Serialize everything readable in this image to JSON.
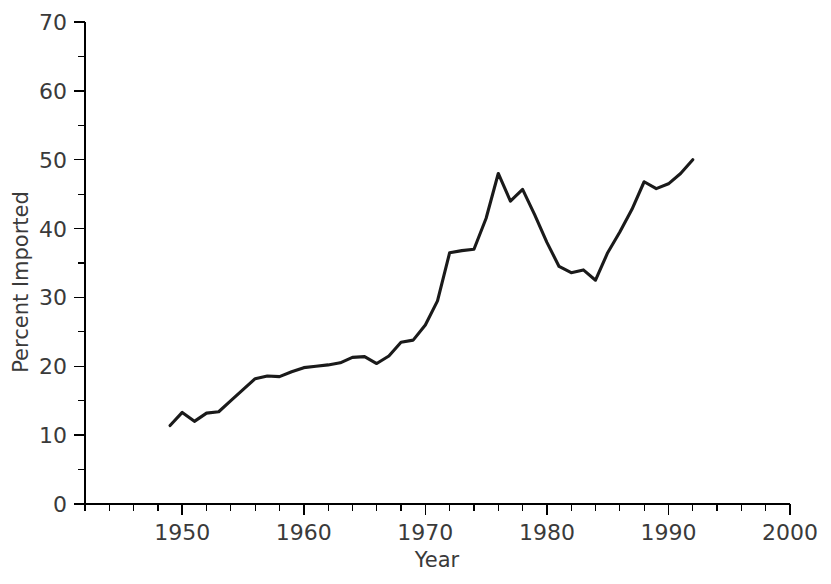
{
  "chart_data": {
    "type": "line",
    "title": "",
    "xlabel": "Year",
    "ylabel": "Percent Imported",
    "xlim": [
      1942,
      2000
    ],
    "ylim": [
      0,
      70
    ],
    "grid": false,
    "legend": null,
    "x_major_ticks": [
      1950,
      1960,
      1970,
      1980,
      1990,
      2000
    ],
    "x_major_tick_labels": [
      "1950",
      "1960",
      "1970",
      "1980",
      "1990",
      "2000"
    ],
    "x_minor_tick_step": 2,
    "y_major_ticks": [
      0,
      10,
      20,
      30,
      40,
      50,
      60,
      70
    ],
    "y_major_tick_labels": [
      "0",
      "10",
      "20",
      "30",
      "40",
      "50",
      "60",
      "70"
    ],
    "y_minor_tick_step": 5,
    "line_color": "#1a1a1a",
    "series": [
      {
        "name": "Percent Imported",
        "x": [
          1949,
          1950,
          1951,
          1952,
          1953,
          1954,
          1955,
          1956,
          1957,
          1958,
          1959,
          1960,
          1961,
          1962,
          1963,
          1964,
          1965,
          1966,
          1967,
          1968,
          1969,
          1970,
          1971,
          1972,
          1973,
          1974,
          1975,
          1976,
          1977,
          1978,
          1979,
          1980,
          1981,
          1982,
          1983,
          1984,
          1985,
          1986,
          1987,
          1988,
          1989,
          1990,
          1991,
          1992
        ],
        "values": [
          11.4,
          13.3,
          12.0,
          13.2,
          13.4,
          15.0,
          16.6,
          18.2,
          18.6,
          18.5,
          19.2,
          19.8,
          20.0,
          20.2,
          20.5,
          21.3,
          21.4,
          20.4,
          21.5,
          23.5,
          23.8,
          26.0,
          29.5,
          36.5,
          36.8,
          37.0,
          41.5,
          48.0,
          44.0,
          45.7,
          42.0,
          38.0,
          34.5,
          33.6,
          34.0,
          32.5,
          36.5,
          39.5,
          42.8,
          46.8,
          45.8,
          46.5,
          48.0,
          50.0
        ],
        "color": "#1a1a1a"
      }
    ]
  },
  "axes": {
    "x_axis_name": "x-axis",
    "y_axis_name": "y-axis"
  }
}
